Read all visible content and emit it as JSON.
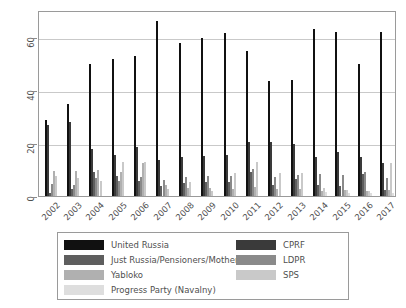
{
  "chart_data": {
    "type": "bar",
    "title": "",
    "xlabel": "",
    "ylabel": "Percent Support",
    "ylim": [
      0,
      70
    ],
    "yticks": [
      0,
      20,
      40,
      60
    ],
    "ytick_labels": [
      "0",
      "20",
      "40",
      "60"
    ],
    "grid": true,
    "grid_axis": "y",
    "legend_position": "below-plot",
    "categories": [
      "2002",
      "2003",
      "2004",
      "2005",
      "2006",
      "2007",
      "2008",
      "2009",
      "2010",
      "2011",
      "2012",
      "2013",
      "2014",
      "2015",
      "2016",
      "2017"
    ],
    "series": [
      {
        "name": "United Russia",
        "color": "#111111",
        "values": [
          28.6,
          34.8,
          49.6,
          51.7,
          52.6,
          65.9,
          57.5,
          59.4,
          61.2,
          54.6,
          43.3,
          43.6,
          62.9,
          61.9,
          49.6,
          61.9
        ]
      },
      {
        "name": "CPRF",
        "color": "#3a3a3a",
        "values": [
          26.6,
          27.7,
          17.6,
          15.6,
          18.5,
          13.6,
          14.7,
          15.1,
          15.3,
          20.4,
          20.4,
          19.4,
          14.6,
          16.5,
          14.5,
          12.5
        ]
      },
      {
        "name": "Just Russia/Pensioners/Motherland",
        "color": "#5e5e5e",
        "values": [
          1.2,
          2.7,
          8.9,
          7.6,
          5.5,
          3.9,
          4.9,
          5.4,
          5.4,
          8.9,
          4.0,
          6.4,
          4.1,
          3.8,
          8.1,
          2.2
        ]
      },
      {
        "name": "LDPR",
        "color": "#8a8a8a",
        "values": [
          4.5,
          4.1,
          6.6,
          5.7,
          7.3,
          5.9,
          7.2,
          7.6,
          7.7,
          10.1,
          7.3,
          7.8,
          8.3,
          7.9,
          9.0,
          6.9
        ]
      },
      {
        "name": "Yabloko",
        "color": "#b0b0b0",
        "values": [
          9.4,
          9.6,
          9.8,
          9.1,
          12.5,
          4.3,
          3.0,
          3.1,
          2.5,
          3.3,
          2.6,
          2.7,
          2.0,
          2.2,
          1.9,
          2.1
        ]
      },
      {
        "name": "SPS",
        "color": "#c9c9c9",
        "values": [
          7.6,
          6.9,
          5.8,
          12.8,
          12.7,
          2.6,
          5.1,
          1.9,
          8.6,
          12.8,
          8.8,
          8.7,
          2.9,
          2.1,
          1.8,
          12.6
        ]
      },
      {
        "name": "Progress Party (Navalny)",
        "color": "#dedede",
        "values": [
          0,
          0,
          0,
          0,
          0,
          0,
          0,
          0,
          0,
          0,
          0,
          0,
          1.4,
          1.2,
          1.0,
          1.1
        ]
      }
    ]
  },
  "legend": {
    "left_column": [
      {
        "label": "United Russia",
        "color": "#111111"
      },
      {
        "label": "Just Russia/Pensioners/Motherland",
        "color": "#5e5e5e"
      },
      {
        "label": "Yabloko",
        "color": "#b0b0b0"
      },
      {
        "label": "Progress Party (Navalny)",
        "color": "#dedede"
      }
    ],
    "right_column": [
      {
        "label": "CPRF",
        "color": "#3a3a3a"
      },
      {
        "label": "LDPR",
        "color": "#8a8a8a"
      },
      {
        "label": "SPS",
        "color": "#c9c9c9"
      }
    ]
  },
  "axis": {
    "y_title": "Percent Support"
  }
}
